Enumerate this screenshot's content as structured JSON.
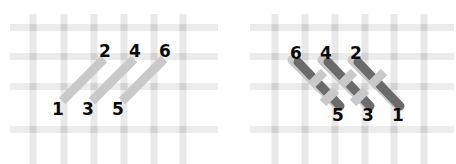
{
  "figure": {
    "type": "braid-weave-diagram",
    "width": 456,
    "height": 164,
    "background": "#ffffff",
    "colors": {
      "grid_line": "#e8e8e8",
      "grid_intersection": "#cfcfcf",
      "light_strand": "#c9c9c9",
      "dark_strand": "#6b6b6b",
      "label_text": "#0a0a0a"
    }
  },
  "grid": {
    "left": {
      "vertical_x": [
        33,
        64,
        94,
        124,
        154,
        183
      ],
      "horizontal_y": [
        27,
        56,
        86,
        129
      ],
      "line_width": 7
    },
    "right": {
      "vertical_x": [
        275,
        305,
        335,
        365,
        394,
        424
      ],
      "horizontal_y": [
        27,
        56,
        86,
        129
      ],
      "line_width": 7
    }
  },
  "panels": [
    {
      "id": "left",
      "name": "unwoven-strands",
      "light_strands": [
        {
          "label_start": "1",
          "label_end": "2",
          "x1": 62,
          "y1": 100,
          "x2": 103,
          "y2": 58
        },
        {
          "label_start": "3",
          "label_end": "4",
          "x1": 92,
          "y1": 100,
          "x2": 133,
          "y2": 58
        },
        {
          "label_start": "5",
          "label_end": "6",
          "x1": 122,
          "y1": 100,
          "x2": 163,
          "y2": 58
        }
      ],
      "dark_strands": [],
      "labels": [
        {
          "text": "1",
          "x": 57,
          "y": 100,
          "position": "bottom"
        },
        {
          "text": "3",
          "x": 87,
          "y": 100,
          "position": "bottom"
        },
        {
          "text": "5",
          "x": 117,
          "y": 100,
          "position": "bottom"
        },
        {
          "text": "2",
          "x": 103,
          "y": 48,
          "position": "top"
        },
        {
          "text": "4",
          "x": 133,
          "y": 48,
          "position": "top"
        },
        {
          "text": "6",
          "x": 163,
          "y": 48,
          "position": "top"
        }
      ]
    },
    {
      "id": "right",
      "name": "woven-strands",
      "light_strands": [
        {
          "label_start": "5",
          "label_end": "6",
          "x1": 335,
          "y1": 103,
          "x2": 294,
          "y2": 61
        },
        {
          "label_start": "3",
          "label_end": "4",
          "x1": 365,
          "y1": 103,
          "x2": 324,
          "y2": 61
        },
        {
          "label_start": "1",
          "label_end": "2",
          "x1": 395,
          "y1": 103,
          "x2": 354,
          "y2": 61
        }
      ],
      "dark_strands": [
        {
          "x1": 297,
          "y1": 63,
          "x2": 339,
          "y2": 105
        },
        {
          "x1": 327,
          "y1": 63,
          "x2": 369,
          "y2": 105
        },
        {
          "x1": 357,
          "y1": 63,
          "x2": 399,
          "y2": 105
        }
      ],
      "labels": [
        {
          "text": "6",
          "x": 294,
          "y": 50,
          "position": "top"
        },
        {
          "text": "4",
          "x": 324,
          "y": 50,
          "position": "top"
        },
        {
          "text": "2",
          "x": 354,
          "y": 50,
          "position": "top"
        },
        {
          "text": "5",
          "x": 331,
          "y": 105,
          "position": "bottom"
        },
        {
          "text": "3",
          "x": 361,
          "y": 105,
          "position": "bottom"
        },
        {
          "text": "1",
          "x": 391,
          "y": 105,
          "position": "bottom"
        }
      ]
    }
  ],
  "labels_left_bottom": [
    "1",
    "3",
    "5"
  ],
  "labels_left_top": [
    "2",
    "4",
    "6"
  ],
  "labels_right_top": [
    "6",
    "4",
    "2"
  ],
  "labels_right_bottom": [
    "5",
    "3",
    "1"
  ]
}
